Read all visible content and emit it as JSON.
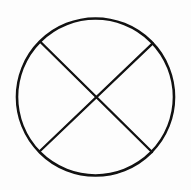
{
  "diagram": {
    "stroke_color": "#111111",
    "background_color": "#fdfdfd",
    "shapes": {
      "circle": {
        "cx": 95.5,
        "cy": 97,
        "r": 78.5,
        "stroke_width": 2.6
      },
      "line_a": {
        "x1": 40.5,
        "y1": 42,
        "x2": 152,
        "y2": 152,
        "stroke_width": 2.4
      },
      "line_b": {
        "x1": 152.7,
        "y1": 43.3,
        "x2": 40,
        "y2": 151,
        "stroke_width": 2.4
      }
    }
  }
}
